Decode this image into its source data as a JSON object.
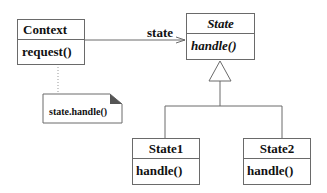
{
  "diagram": {
    "type": "uml-class-diagram",
    "classes": [
      {
        "id": "context",
        "name": "Context",
        "operations": [
          "request()"
        ],
        "abstract": false
      },
      {
        "id": "state",
        "name": "State",
        "operations": [
          "handle()"
        ],
        "abstract": true
      },
      {
        "id": "state1",
        "name": "State1",
        "operations": [
          "handle()"
        ],
        "abstract": false
      },
      {
        "id": "state2",
        "name": "State2",
        "operations": [
          "handle()"
        ],
        "abstract": false
      }
    ],
    "association": {
      "from": "Context",
      "to": "State",
      "label": "state"
    },
    "generalization": {
      "parent": "State",
      "children": [
        "State1",
        "State2"
      ]
    },
    "note": {
      "text": "state.handle()",
      "attached_to": "request()"
    }
  },
  "colors": {
    "line": "#6a6a6a",
    "text": "#111111",
    "note_fold": "#555555"
  }
}
